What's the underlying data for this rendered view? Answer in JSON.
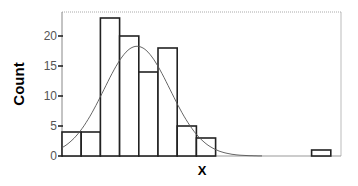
{
  "chart_data": {
    "type": "bar",
    "subtype": "histogram",
    "title": "",
    "xlabel": "X",
    "ylabel": "Count",
    "ylim": [
      0,
      25
    ],
    "yticks": [
      0,
      5,
      10,
      15,
      20
    ],
    "xticks": [],
    "grid": false,
    "legend": null,
    "bins": [
      {
        "index": 1,
        "count": 4
      },
      {
        "index": 2,
        "count": 4
      },
      {
        "index": 3,
        "count": 23
      },
      {
        "index": 4,
        "count": 20
      },
      {
        "index": 5,
        "count": 14
      },
      {
        "index": 6,
        "count": 18
      },
      {
        "index": 7,
        "count": 5
      },
      {
        "index": 8,
        "count": 3
      },
      {
        "index": 9,
        "count": 0
      },
      {
        "index": 10,
        "count": 0
      },
      {
        "index": 11,
        "count": 0
      },
      {
        "index": 12,
        "count": 0
      },
      {
        "index": 13,
        "count": 0
      },
      {
        "index": 14,
        "count": 1
      }
    ],
    "values": [
      4,
      4,
      23,
      20,
      14,
      18,
      5,
      3,
      0,
      0,
      0,
      0,
      0,
      1
    ],
    "overlay": {
      "type": "normal-curve",
      "peak_count": 18.3,
      "peak_bin_position": 4.0
    }
  },
  "colors": {
    "bar_fill": "#ffffff",
    "bar_stroke": "#222222",
    "curve": "#555555",
    "frame": "#aaaaaa",
    "axis": "#222222"
  }
}
